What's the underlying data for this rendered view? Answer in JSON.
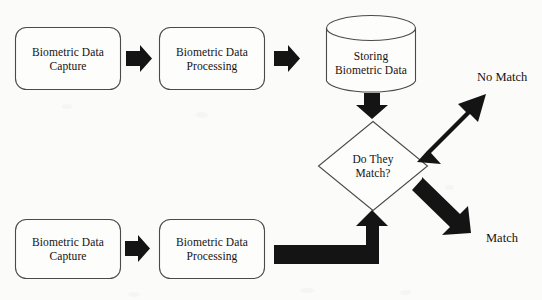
{
  "diagram": {
    "background_color": "#fbfbfa",
    "stroke_color": "#444444",
    "arrow_color": "#141414",
    "text_color": "#15120f",
    "nodes": [
      {
        "id": "capture-top",
        "type": "rounded-rectangle",
        "label": "Biometric Data\nCapture",
        "x": 15,
        "y": 27,
        "w": 106,
        "h": 63
      },
      {
        "id": "processing-top",
        "type": "rounded-rectangle",
        "label": "Biometric Data\nProcessing",
        "x": 159,
        "y": 27,
        "w": 106,
        "h": 63
      },
      {
        "id": "storage",
        "type": "cylinder",
        "label": "Storing\nBiometric Data",
        "x": 326,
        "y": 15,
        "w": 90,
        "h": 79
      },
      {
        "id": "decision",
        "type": "diamond",
        "label": "Do They\nMatch?",
        "x": 318,
        "y": 121,
        "w": 110,
        "h": 90
      },
      {
        "id": "capture-bottom",
        "type": "rounded-rectangle",
        "label": "Biometric Data\nCapture",
        "x": 15,
        "y": 219,
        "w": 106,
        "h": 60
      },
      {
        "id": "processing-bottom",
        "type": "rounded-rectangle",
        "label": "Biometric Data\nProcessing",
        "x": 159,
        "y": 219,
        "w": 106,
        "h": 60
      }
    ],
    "connectors": [
      {
        "id": "arrow-capture-to-processing-top",
        "type": "block-arrow-right"
      },
      {
        "id": "arrow-processing-to-storage",
        "type": "block-arrow-right"
      },
      {
        "id": "arrow-storage-to-decision",
        "type": "block-arrow-down"
      },
      {
        "id": "arrow-decision-to-no-match",
        "type": "block-arrow-diagonal-up-right"
      },
      {
        "id": "arrow-decision-to-match",
        "type": "block-arrow-diagonal-down-right"
      },
      {
        "id": "arrow-capture-to-processing-bottom",
        "type": "block-arrow-right"
      },
      {
        "id": "arrow-processing-bottom-to-decision",
        "type": "block-arrow-elbow-up"
      }
    ],
    "labels": [
      {
        "id": "no-match-label",
        "text": "No Match",
        "x": 477,
        "y": 70
      },
      {
        "id": "match-label",
        "text": "Match",
        "x": 486,
        "y": 231
      }
    ]
  }
}
